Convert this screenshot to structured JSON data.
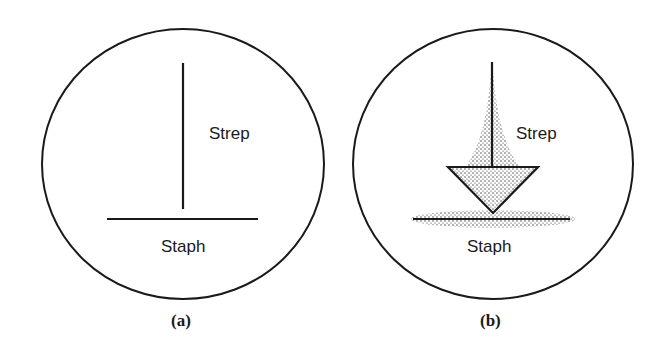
{
  "panels": [
    {
      "id": "a",
      "caption": "(a)",
      "labels": {
        "vertical": "Strep",
        "horizontal": "Staph"
      }
    },
    {
      "id": "b",
      "caption": "(b)",
      "labels": {
        "vertical": "Strep",
        "horizontal": "Staph"
      }
    }
  ],
  "colors": {
    "ink": "#1a1a1a",
    "stipple": "#2a2a2a",
    "background": "#ffffff"
  }
}
